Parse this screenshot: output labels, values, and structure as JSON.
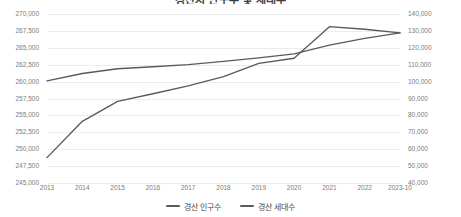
{
  "chart_data": {
    "type": "line",
    "title": "경산시 인구수 및 세대수",
    "xlabel": "",
    "ylabel": "",
    "grid": true,
    "legend_position": "bottom",
    "categories": [
      "2013",
      "2014",
      "2015",
      "2016",
      "2017",
      "2018",
      "2019",
      "2020",
      "2021",
      "2022",
      "2023-10"
    ],
    "axes": {
      "left": {
        "name": "경산 인구수",
        "ylim": [
          245000,
          270000
        ],
        "tick_step": 2500,
        "ticks": [
          "245,000",
          "247,500",
          "250,000",
          "252,500",
          "255,000",
          "257,500",
          "260,000",
          "262,500",
          "265,000",
          "267,500",
          "270,000"
        ]
      },
      "right": {
        "name": "경산 세대수",
        "ylim": [
          40000,
          140000
        ],
        "tick_step": 10000,
        "ticks": [
          "40,000",
          "50,000",
          "60,000",
          "70,000",
          "80,000",
          "90,000",
          "100,000",
          "110,000",
          "120,000",
          "130,000",
          "140,000"
        ]
      }
    },
    "series": [
      {
        "name": "경산 인구수",
        "axis": "left",
        "color": "#5a5a5a",
        "values": [
          260100,
          261200,
          261900,
          262200,
          262500,
          263000,
          263500,
          264100,
          265400,
          266400,
          267200
        ]
      },
      {
        "name": "경산 세대수",
        "axis": "right",
        "color": "#5a5a5a",
        "values": [
          55000,
          76500,
          88300,
          92800,
          97500,
          103000,
          110800,
          113800,
          132500,
          131000,
          128800
        ]
      }
    ]
  },
  "legend": {
    "items": [
      {
        "label": "경산 인구수"
      },
      {
        "label": "경산 세대수"
      }
    ]
  }
}
